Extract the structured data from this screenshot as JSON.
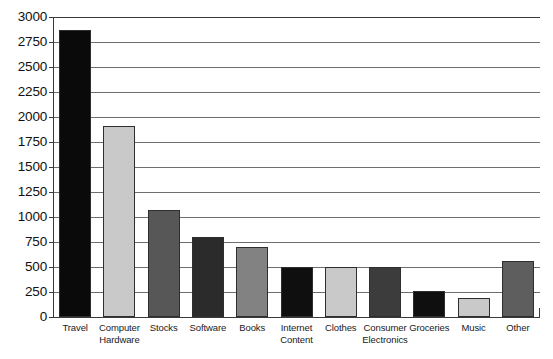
{
  "chart_data": {
    "type": "bar",
    "title": "",
    "subtitle": "",
    "xlabel": "",
    "ylabel": "",
    "categories": [
      "Travel",
      "Computer Hardware",
      "Stocks",
      "Software",
      "Books",
      "Internet Content",
      "Clothes",
      "Consumer Electronics",
      "Groceries",
      "Music",
      "Other"
    ],
    "values": [
      2870,
      1910,
      1075,
      800,
      700,
      500,
      500,
      500,
      260,
      190,
      560
    ],
    "bar_colors": [
      "#0a0a0a",
      "#c9c9c9",
      "#575757",
      "#2b2b2b",
      "#828282",
      "#0f0f0f",
      "#c9c9c9",
      "#3c3c3c",
      "#0f0f0f",
      "#c9c9c9",
      "#5e5e5e"
    ],
    "ylim": [
      0,
      3000
    ],
    "ytick_step": 250,
    "yticks": [
      0,
      250,
      500,
      750,
      1000,
      1250,
      1500,
      1750,
      2000,
      2250,
      2500,
      2750,
      3000
    ],
    "ytick_labels": [
      "0",
      "250",
      "500",
      "750",
      "1000",
      "1250",
      "1500",
      "1750",
      "2000",
      "2250",
      "2500",
      "2750",
      "3000"
    ],
    "grid": true,
    "grid_axis": "y",
    "legend": false,
    "legend_position": "none",
    "background_color": "#ffffff",
    "axis_color": "#3a3a3a",
    "gridline_color": "#6e6e6e"
  }
}
